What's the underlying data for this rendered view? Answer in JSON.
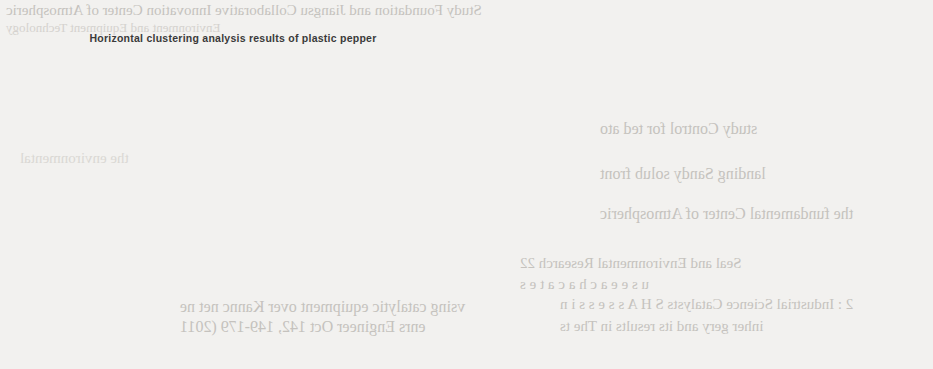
{
  "page": {
    "background_color": "#f2f1ef",
    "ink_color": "#2e2e2e"
  },
  "bleed_through_text": {
    "note": "faint mirrored text showing through from the reverse side of the scanned page",
    "lines": [
      "Study   Foundation and   Jiangsu Collaborative Innovation Center of Atmospheric",
      "Environment and Equipment Technology",
      "vsing catalytic   equipment  over  Kannc   net  ne",
      "enrs   Engineer   Oct 142,  149-179 (2011",
      "Seal and Environmental Research 22",
      "u s e   e a c h   a   c a t e s",
      "study   Control   for ted ato",
      "landing   Sandy solub   front",
      "2 : Industrial Science   Catalysts   S H A s s e s s i n",
      "inher   gery and   its   results  in  The   ts",
      "the fundamental Center of Atmospheric",
      "the environmental"
    ]
  },
  "chart_data": [
    {
      "id": "left",
      "type": "scatter",
      "projection": "3d",
      "title": "Horizontal clustering analysis results of plastic pepper",
      "xlabel": "entropy",
      "ylabel": "expectancy",
      "zlabel": "hyper entropy",
      "grid": true,
      "legend": "none",
      "axes": {
        "entropy": {
          "ticks": [
            5,
            4,
            3,
            2,
            1,
            0
          ],
          "min": 0,
          "max": 5
        },
        "expectancy": {
          "ticks": [
            0,
            2,
            4,
            6,
            8,
            10
          ],
          "min": 0,
          "max": 10
        },
        "hyper_entropy": {
          "ticks": [
            3,
            2,
            1,
            0,
            -1,
            -2
          ],
          "min": -2,
          "max": 3
        }
      },
      "series": [
        {
          "name": "cluster-1",
          "marker": "open-circle",
          "color": "#8a8a8a",
          "count": 86,
          "center": {
            "entropy": 2.6,
            "expectancy": 1.6,
            "hyper_entropy": -0.1
          },
          "spread": {
            "entropy": 0.75,
            "expectancy": 0.85,
            "hyper_entropy": 0.5
          }
        },
        {
          "name": "cluster-2",
          "marker": "filled-circle",
          "color": "#4a4a4a",
          "count": 108,
          "center": {
            "entropy": 2.3,
            "expectancy": 5.0,
            "hyper_entropy": -0.35
          },
          "spread": {
            "entropy": 0.9,
            "expectancy": 1.1,
            "hyper_entropy": 0.55
          }
        },
        {
          "name": "cluster-3",
          "marker": "filled-square",
          "color": "#3d3d3d",
          "count": 74,
          "center": {
            "entropy": 2.1,
            "expectancy": 7.9,
            "hyper_entropy": -0.45
          },
          "spread": {
            "entropy": 1.0,
            "expectancy": 1.0,
            "hyper_entropy": 0.55
          }
        }
      ]
    },
    {
      "id": "right",
      "type": "scatter",
      "projection": "3d",
      "title": "",
      "xlabel": "entropy",
      "ylabel": "expectancy",
      "zlabel": "hyper entropy",
      "grid": true,
      "legend": "none",
      "style": "radial-star-links-to-centroid",
      "axes": {
        "entropy": {
          "ticks": [
            6,
            4,
            2,
            0,
            -2
          ],
          "min": -2,
          "max": 6
        },
        "expectancy": {
          "ticks": [
            0,
            2,
            4,
            6,
            8,
            10
          ],
          "min": 0,
          "max": 10
        },
        "hyper_entropy": {
          "ticks": [
            2,
            1,
            0,
            -1,
            -2
          ],
          "min": -2,
          "max": 2
        }
      },
      "series": [
        {
          "name": "star-1",
          "marker": "filled-dot",
          "color": "#5a5a5a",
          "count": 78,
          "center": {
            "entropy": 2.6,
            "expectancy": 2.0,
            "hyper_entropy": 0.0
          },
          "spread": {
            "entropy": 0.8,
            "expectancy": 0.9,
            "hyper_entropy": 0.55
          }
        },
        {
          "name": "star-2",
          "marker": "filled-dot",
          "color": "#4f4f4f",
          "count": 92,
          "center": {
            "entropy": 2.6,
            "expectancy": 5.6,
            "hyper_entropy": 0.0
          },
          "spread": {
            "entropy": 0.9,
            "expectancy": 1.0,
            "hyper_entropy": 0.6
          }
        },
        {
          "name": "star-3",
          "marker": "filled-dot",
          "color": "#787878",
          "count": 74,
          "center": {
            "entropy": 2.0,
            "expectancy": 7.6,
            "hyper_entropy": -0.3
          },
          "spread": {
            "entropy": 0.85,
            "expectancy": 0.95,
            "hyper_entropy": 0.55
          }
        }
      ]
    }
  ]
}
